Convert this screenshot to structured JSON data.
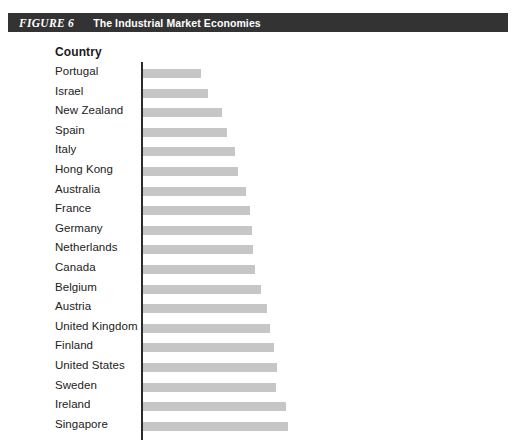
{
  "figure": {
    "number_label": "FIGURE 6",
    "title": "The Industrial Market Economies"
  },
  "colors": {
    "header_band": "#333333",
    "header_text": "#ffffff",
    "bar_fill": "#c6c6c6",
    "axis_line": "#2b2b2b",
    "label_text": "#222222"
  },
  "table": {
    "column_header": "Country"
  },
  "chart_data": {
    "type": "bar",
    "orientation": "horizontal",
    "title": "The Industrial Market Economies",
    "xlabel": "",
    "ylabel": "Country",
    "grid": false,
    "legend": false,
    "axis_visible": {
      "x": false,
      "y": true
    },
    "tick_labels": [],
    "xlim": [
      0,
      150
    ],
    "note": "Values are relative bar lengths measured from the figure; no numeric axis is printed in the image.",
    "categories": [
      "Portugal",
      "Israel",
      "New Zealand",
      "Spain",
      "Italy",
      "Hong Kong",
      "Australia",
      "France",
      "Germany",
      "Netherlands",
      "Canada",
      "Belgium",
      "Austria",
      "United Kingdom",
      "Finland",
      "United States",
      "Sweden",
      "Ireland",
      "Singapore"
    ],
    "values": [
      58,
      65,
      79,
      84,
      92,
      95,
      103,
      107,
      109,
      110,
      112,
      118,
      124,
      127,
      131,
      134,
      133,
      143,
      145
    ]
  }
}
